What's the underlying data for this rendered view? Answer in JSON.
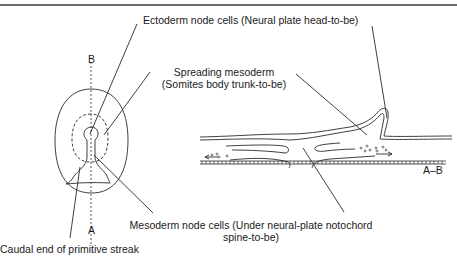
{
  "labels": {
    "ectoderm": "Ectoderm node cells (Neural plate head-to-be)",
    "spreading_line1": "Spreading mesoderm",
    "spreading_line2": "(Somites body trunk-to-be)",
    "mesoderm_line1": "Mesoderm node cells (Under neural-plate notochord",
    "mesoderm_line2": "spine-to-be)",
    "caudal": "Caudal end of primitive streak",
    "axis_top": "B",
    "axis_bottom": "A",
    "section": "A–B"
  },
  "colors": {
    "line": "#2a2a2a",
    "rule": "#6e6e6e",
    "text": "#1a1a1a"
  }
}
